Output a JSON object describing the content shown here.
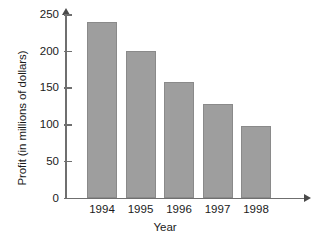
{
  "chart_data": {
    "type": "bar",
    "title": "",
    "xlabel": "Year",
    "ylabel": "Profit (in millions of dollars)",
    "categories": [
      "1994",
      "1995",
      "1996",
      "1997",
      "1998"
    ],
    "values": [
      239,
      199,
      157,
      127,
      97
    ],
    "ylim": [
      0,
      250
    ],
    "yticks": [
      0,
      50,
      100,
      150,
      200,
      250
    ],
    "ytick_labels": [
      "0",
      "50",
      "100",
      "150",
      "200",
      "250"
    ],
    "grid": false,
    "legend": null,
    "series": [
      {
        "name": "Profit",
        "values": [
          239,
          199,
          157,
          127,
          97
        ]
      }
    ],
    "bar_color": "#9e9e9e",
    "bar_border_color": "#8a8a8a",
    "axis_color": "#6f6f6f",
    "axis_style": "arrow-tipped-open-axes"
  },
  "figure": {
    "caption_fragment": "",
    "background": "#ffffff"
  }
}
